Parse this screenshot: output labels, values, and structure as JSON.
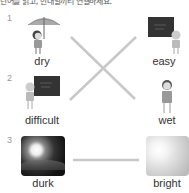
{
  "instruction": "단어를 읽고, 반대말끼리 연결하세요.",
  "items": [
    {
      "number": "1",
      "left": {
        "word": "dry",
        "icon": "girl-with-umbrella-icon"
      },
      "right": {
        "word": "easy",
        "icon": "girl-at-blackboard-icon"
      }
    },
    {
      "number": "2",
      "left": {
        "word": "difficult",
        "icon": "girl-at-blackboard-icon"
      },
      "right": {
        "word": "wet",
        "icon": "boy-icon"
      }
    },
    {
      "number": "3",
      "left": {
        "word": "durk",
        "icon": "night-moon-photo"
      },
      "right": {
        "word": "bright",
        "icon": "bright-sun-photo"
      }
    }
  ],
  "line_color": "#c8c8c8"
}
